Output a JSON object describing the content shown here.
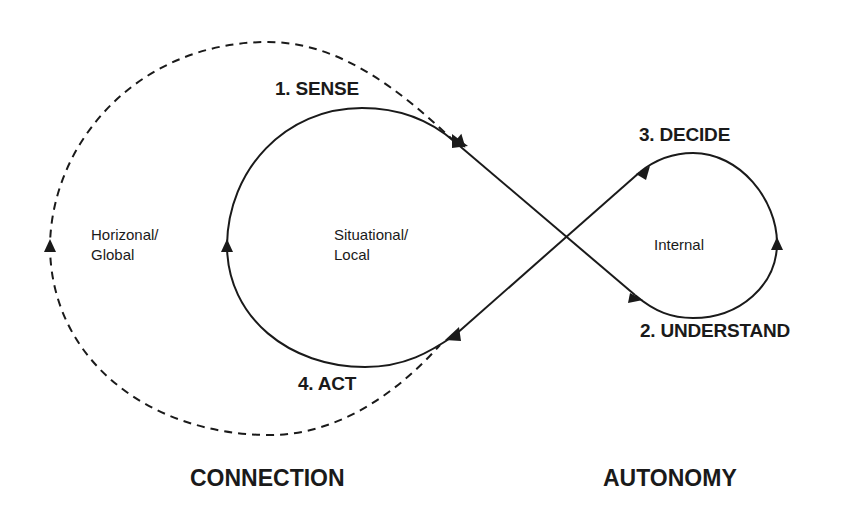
{
  "diagram": {
    "type": "figure-eight cycle diagram",
    "steps": [
      {
        "id": "sense",
        "label": "1. SENSE"
      },
      {
        "id": "understand",
        "label": "2. UNDERSTAND"
      },
      {
        "id": "decide",
        "label": "3. DECIDE"
      },
      {
        "id": "act",
        "label": "4. ACT"
      }
    ],
    "regions": {
      "global": {
        "line1": "Horizonal/",
        "line2": "Global"
      },
      "local": {
        "line1": "Situational/",
        "line2": "Local"
      },
      "internal": {
        "line1": "Internal"
      }
    },
    "poles": {
      "left": "CONNECTION",
      "right": "AUTONOMY"
    },
    "loops": [
      {
        "id": "outer-dashed",
        "style": "dashed",
        "encloses": "Horizonal/ Global"
      },
      {
        "id": "left-solid",
        "style": "solid",
        "encloses": "Situational/ Local"
      },
      {
        "id": "right-solid",
        "style": "solid",
        "encloses": "Internal"
      }
    ],
    "colors": {
      "stroke": "#1a1a1a",
      "background": "#ffffff"
    }
  }
}
